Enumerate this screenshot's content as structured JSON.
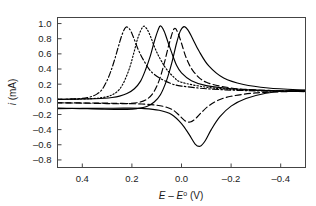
{
  "figure": {
    "title": "",
    "background": "#ffffff"
  },
  "axes": {
    "x": {
      "label_parts": {
        "e1": "E",
        "minus": " – ",
        "e2": "E",
        "sup": "o",
        "unit": " (V)"
      },
      "label_text": "E – E° (V)",
      "ticks": [
        "0.4",
        "0.2",
        "0.0",
        "–0.2",
        "–0.4"
      ],
      "tick_values": [
        0.4,
        0.2,
        0.0,
        -0.2,
        -0.4
      ],
      "range": [
        0.5,
        -0.5
      ],
      "reversed": true
    },
    "y": {
      "label_parts": {
        "sym": "i",
        "unit": " (mA)"
      },
      "label_text": "i (mA)",
      "ticks": [
        "1.0",
        "0.8",
        "0.6",
        "0.4",
        "0.2",
        "0.0",
        "–0.2",
        "–0.4",
        "–0.6",
        "–0.8"
      ],
      "tick_values": [
        1.0,
        0.8,
        0.6,
        0.4,
        0.2,
        0.0,
        -0.2,
        -0.4,
        -0.6,
        -0.8
      ],
      "range": [
        -0.9,
        1.08
      ]
    }
  },
  "chart_data": {
    "type": "line",
    "title": "",
    "xlabel": "E – E° (V)",
    "ylabel": "i (mA)",
    "xlim": [
      0.5,
      -0.5
    ],
    "ylim": [
      -0.9,
      1.08
    ],
    "grid": false,
    "legend": "none",
    "series": [
      {
        "name": "curve-1",
        "style": "dash-dot",
        "color": "#000000",
        "peak_anodic": {
          "x": 0.225,
          "y": 0.95
        },
        "peak_cathodic": null,
        "x": [
          0.5,
          0.45,
          0.42,
          0.4,
          0.38,
          0.36,
          0.34,
          0.32,
          0.3,
          0.285,
          0.27,
          0.255,
          0.24,
          0.225,
          0.21,
          0.195,
          0.18,
          0.165,
          0.15,
          0.13,
          0.11,
          0.08,
          0.04,
          0.0,
          -0.1,
          -0.2,
          -0.3,
          -0.4,
          -0.5
        ],
        "y": [
          0.0,
          0.003,
          0.007,
          0.012,
          0.022,
          0.04,
          0.072,
          0.13,
          0.25,
          0.37,
          0.52,
          0.69,
          0.85,
          0.95,
          0.93,
          0.83,
          0.7,
          0.59,
          0.5,
          0.395,
          0.33,
          0.265,
          0.205,
          0.175,
          0.14,
          0.122,
          0.112,
          0.106,
          0.102
        ]
      },
      {
        "name": "curve-2",
        "style": "dotted",
        "color": "#000000",
        "peak_anodic": {
          "x": 0.155,
          "y": 0.96
        },
        "peak_cathodic": null,
        "x": [
          0.5,
          0.44,
          0.4,
          0.36,
          0.33,
          0.3,
          0.28,
          0.26,
          0.24,
          0.22,
          0.205,
          0.19,
          0.175,
          0.155,
          0.14,
          0.125,
          0.11,
          0.095,
          0.08,
          0.06,
          0.03,
          0.0,
          -0.1,
          -0.2,
          -0.3,
          -0.4,
          -0.5
        ],
        "y": [
          0.0,
          0.002,
          0.005,
          0.01,
          0.018,
          0.035,
          0.058,
          0.1,
          0.18,
          0.32,
          0.46,
          0.64,
          0.82,
          0.96,
          0.93,
          0.83,
          0.7,
          0.59,
          0.5,
          0.395,
          0.29,
          0.225,
          0.16,
          0.132,
          0.118,
          0.11,
          0.104
        ]
      },
      {
        "name": "curve-3",
        "style": "light-solid",
        "color": "#9a9a9a",
        "peak_anodic": {
          "x": 0.085,
          "y": 0.97
        },
        "peak_cathodic": {
          "x": 0.02,
          "y": -0.05
        },
        "x": [
          0.5,
          0.44,
          0.4,
          0.35,
          0.31,
          0.28,
          0.25,
          0.22,
          0.19,
          0.165,
          0.145,
          0.125,
          0.11,
          0.095,
          0.085,
          0.07,
          0.055,
          0.04,
          0.02,
          0.0,
          -0.04,
          -0.1,
          -0.2,
          -0.3,
          -0.4,
          -0.5
        ],
        "y": [
          0.0,
          0.002,
          0.004,
          0.008,
          0.014,
          0.024,
          0.042,
          0.076,
          0.14,
          0.24,
          0.39,
          0.58,
          0.76,
          0.91,
          0.97,
          0.9,
          0.76,
          0.62,
          0.45,
          0.35,
          0.245,
          0.18,
          0.14,
          0.122,
          0.112,
          0.105
        ]
      },
      {
        "name": "curve-4",
        "style": "dashed",
        "color": "#000000",
        "peak_anodic": {
          "x": 0.03,
          "y": 0.93
        },
        "peak_cathodic": {
          "x": -0.035,
          "y": -0.3
        },
        "x": [
          0.5,
          0.44,
          0.4,
          0.35,
          0.3,
          0.26,
          0.22,
          0.18,
          0.145,
          0.115,
          0.09,
          0.07,
          0.05,
          0.03,
          0.015,
          0.0,
          -0.02,
          -0.05,
          -0.1,
          -0.2,
          -0.3,
          -0.4,
          -0.5
        ],
        "y": [
          -0.045,
          -0.048,
          -0.05,
          -0.053,
          -0.056,
          -0.058,
          -0.056,
          -0.045,
          -0.01,
          0.08,
          0.25,
          0.47,
          0.73,
          0.93,
          0.88,
          0.74,
          0.54,
          0.36,
          0.225,
          0.15,
          0.125,
          0.112,
          0.106
        ]
      },
      {
        "name": "curve-4-return",
        "style": "dashed",
        "color": "#000000",
        "peak_cathodic": {
          "x": -0.035,
          "y": -0.3
        },
        "x": [
          -0.5,
          -0.4,
          -0.3,
          -0.2,
          -0.15,
          -0.11,
          -0.08,
          -0.055,
          -0.035,
          -0.015,
          0.005,
          0.03,
          0.06,
          0.1,
          0.16,
          0.24,
          0.32,
          0.4,
          0.5
        ],
        "y": [
          0.105,
          0.1,
          0.085,
          0.04,
          -0.01,
          -0.085,
          -0.175,
          -0.26,
          -0.3,
          -0.285,
          -0.225,
          -0.15,
          -0.105,
          -0.078,
          -0.062,
          -0.054,
          -0.05,
          -0.048,
          -0.046
        ]
      },
      {
        "name": "curve-5",
        "style": "solid",
        "color": "#000000",
        "peak_anodic": {
          "x": -0.01,
          "y": 0.96
        },
        "peak_cathodic": {
          "x": -0.075,
          "y": -0.62
        },
        "x": [
          0.5,
          0.44,
          0.38,
          0.32,
          0.27,
          0.22,
          0.18,
          0.14,
          0.11,
          0.085,
          0.06,
          0.04,
          0.02,
          0.005,
          -0.01,
          -0.025,
          -0.045,
          -0.07,
          -0.11,
          -0.17,
          -0.25,
          -0.35,
          -0.5
        ],
        "y": [
          -0.115,
          -0.12,
          -0.125,
          -0.13,
          -0.133,
          -0.132,
          -0.122,
          -0.095,
          -0.035,
          0.06,
          0.25,
          0.47,
          0.74,
          0.9,
          0.96,
          0.92,
          0.8,
          0.64,
          0.44,
          0.28,
          0.195,
          0.15,
          0.12
        ]
      },
      {
        "name": "curve-5-return",
        "style": "solid",
        "color": "#000000",
        "peak_cathodic": {
          "x": -0.075,
          "y": -0.62
        },
        "x": [
          -0.5,
          -0.42,
          -0.34,
          -0.26,
          -0.2,
          -0.155,
          -0.12,
          -0.095,
          -0.075,
          -0.055,
          -0.03,
          0.0,
          0.04,
          0.09,
          0.15,
          0.22,
          0.3,
          0.4,
          0.5
        ],
        "y": [
          0.12,
          0.11,
          0.08,
          0.01,
          -0.09,
          -0.23,
          -0.4,
          -0.55,
          -0.62,
          -0.59,
          -0.46,
          -0.32,
          -0.2,
          -0.145,
          -0.122,
          -0.117,
          -0.118,
          -0.12,
          -0.122
        ]
      }
    ]
  }
}
